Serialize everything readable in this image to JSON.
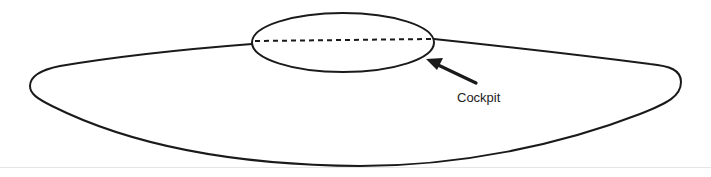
{
  "diagram": {
    "title": "",
    "labels": {
      "cockpit": "Cockpit"
    },
    "colors": {
      "stroke": "#1a1a1a",
      "background": "#ffffff",
      "baseline": "#e6e6e6"
    },
    "shapes": {
      "body": "flat-saucer-outline",
      "cockpit": "ellipse-with-dashed-centerline",
      "pointer": "arrow-pointing-to-cockpit"
    }
  }
}
